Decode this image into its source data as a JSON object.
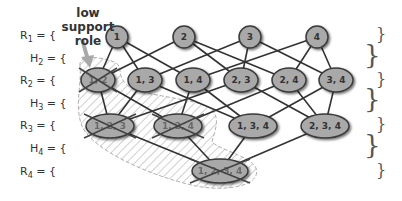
{
  "annotation": {
    "line1": "low support",
    "line2": "role"
  },
  "rows": [
    {
      "id": "R1",
      "base": "R",
      "sub": "1",
      "eq": " = {",
      "close": "}"
    },
    {
      "id": "H2",
      "base": "H",
      "sub": "2",
      "eq": " = {",
      "close": "}"
    },
    {
      "id": "R2",
      "base": "R",
      "sub": "2",
      "eq": " = {",
      "close": "}"
    },
    {
      "id": "H3",
      "base": "H",
      "sub": "3",
      "eq": " = {",
      "close": "}"
    },
    {
      "id": "R3",
      "base": "R",
      "sub": "3",
      "eq": " = {",
      "close": "}"
    },
    {
      "id": "H4",
      "base": "H",
      "sub": "4",
      "eq": " = {",
      "close": "}"
    },
    {
      "id": "R4",
      "base": "R",
      "sub": "4",
      "eq": " = {",
      "close": "}"
    }
  ],
  "nodes": [
    {
      "id": "n1",
      "label": "1",
      "level": 1,
      "pruned": false
    },
    {
      "id": "n2",
      "label": "2",
      "level": 1,
      "pruned": false
    },
    {
      "id": "n3",
      "label": "3",
      "level": 1,
      "pruned": false
    },
    {
      "id": "n4",
      "label": "4",
      "level": 1,
      "pruned": false
    },
    {
      "id": "n12",
      "label": "1, 2",
      "level": 2,
      "pruned": true
    },
    {
      "id": "n13",
      "label": "1, 3",
      "level": 2,
      "pruned": false
    },
    {
      "id": "n14",
      "label": "1, 4",
      "level": 2,
      "pruned": false
    },
    {
      "id": "n23",
      "label": "2, 3",
      "level": 2,
      "pruned": false
    },
    {
      "id": "n24",
      "label": "2, 4",
      "level": 2,
      "pruned": false
    },
    {
      "id": "n34",
      "label": "3, 4",
      "level": 2,
      "pruned": false
    },
    {
      "id": "n123",
      "label": "1, 2, 3",
      "level": 3,
      "pruned": true
    },
    {
      "id": "n124",
      "label": "1, 2, 4",
      "level": 3,
      "pruned": true
    },
    {
      "id": "n134",
      "label": "1, 3, 4",
      "level": 3,
      "pruned": false
    },
    {
      "id": "n234",
      "label": "2, 3, 4",
      "level": 3,
      "pruned": false
    },
    {
      "id": "n1234",
      "label": "1, 2, 3, 4",
      "level": 4,
      "pruned": true
    }
  ],
  "edges": [
    [
      "n1",
      "n12"
    ],
    [
      "n1",
      "n13"
    ],
    [
      "n1",
      "n14"
    ],
    [
      "n2",
      "n12"
    ],
    [
      "n2",
      "n23"
    ],
    [
      "n2",
      "n24"
    ],
    [
      "n3",
      "n13"
    ],
    [
      "n3",
      "n23"
    ],
    [
      "n3",
      "n34"
    ],
    [
      "n4",
      "n14"
    ],
    [
      "n4",
      "n24"
    ],
    [
      "n4",
      "n34"
    ],
    [
      "n12",
      "n123"
    ],
    [
      "n12",
      "n124"
    ],
    [
      "n13",
      "n123"
    ],
    [
      "n13",
      "n134"
    ],
    [
      "n14",
      "n124"
    ],
    [
      "n14",
      "n134"
    ],
    [
      "n23",
      "n123"
    ],
    [
      "n23",
      "n234"
    ],
    [
      "n24",
      "n124"
    ],
    [
      "n24",
      "n234"
    ],
    [
      "n34",
      "n134"
    ],
    [
      "n34",
      "n234"
    ],
    [
      "n123",
      "n1234"
    ],
    [
      "n124",
      "n1234"
    ],
    [
      "n134",
      "n1234"
    ],
    [
      "n234",
      "n1234"
    ]
  ],
  "colors": {
    "node_fill": "#a9a9a9",
    "node_stroke": "#3a3a3a",
    "edge": "#333333",
    "hatch": "#bdbdbd",
    "arrow": "#a0a0a0"
  }
}
